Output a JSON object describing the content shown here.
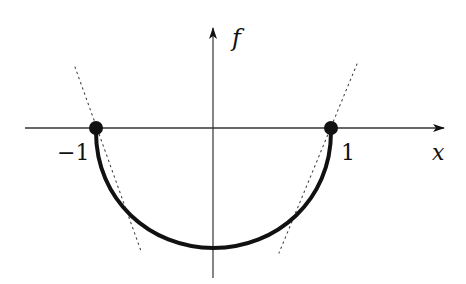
{
  "diagram": {
    "type": "function-plot",
    "axes": {
      "x_label": "x",
      "y_label": "f",
      "x_ticks": [
        {
          "value": -1,
          "label": "−1"
        },
        {
          "value": 1,
          "label": "1"
        }
      ]
    },
    "curve": {
      "description": "lower semicircle f(x) = -sqrt(1 - x^2) on [-1, 1]",
      "domain": [
        -1,
        1
      ],
      "minimum": -1
    },
    "endpoints": [
      {
        "x": -1,
        "y": 0,
        "style": "filled-dot"
      },
      {
        "x": 1,
        "y": 0,
        "style": "filled-dot"
      }
    ],
    "tangent_lines": [
      {
        "near": -1,
        "style": "dotted"
      },
      {
        "near": 1,
        "style": "dotted"
      }
    ],
    "colors": {
      "ink": "#111111",
      "axis": "#333333",
      "background": "#ffffff"
    }
  }
}
